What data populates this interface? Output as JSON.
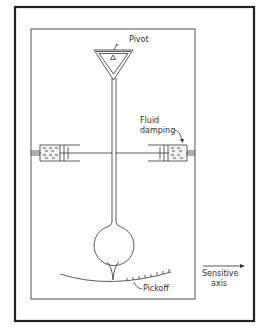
{
  "diagram": {
    "labels": {
      "pivot": "Pivot",
      "fluid_damping_line1": "Fluid",
      "fluid_damping_line2": "damping",
      "pickoff": "Pickoff",
      "sensitive_axis_line1": "Sensitive",
      "sensitive_axis_line2": "axis"
    },
    "components": [
      "outer-frame",
      "inner-case",
      "pivot-triangle",
      "pendulum-stem",
      "left-damper",
      "right-damper",
      "pendulum-mass",
      "pickoff-scale",
      "sensitive-axis-arrow"
    ],
    "colors": {
      "line": "#333333",
      "frame": "#222222",
      "background": "#ffffff"
    }
  }
}
